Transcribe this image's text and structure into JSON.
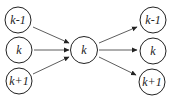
{
  "diagram": {
    "type": "flow",
    "colors": {
      "stroke": "#222222",
      "background": "#ffffff"
    },
    "nodes": [
      {
        "id": "in_km1",
        "label": "k-1",
        "cx": 18,
        "cy": 20,
        "r": 13
      },
      {
        "id": "in_k",
        "label": "k",
        "cx": 19,
        "cy": 50,
        "r": 13
      },
      {
        "id": "in_kp1",
        "label": "k+1",
        "cx": 19,
        "cy": 81,
        "r": 13
      },
      {
        "id": "center_k",
        "label": "k",
        "cx": 84,
        "cy": 50,
        "r": 13
      },
      {
        "id": "out_km1",
        "label": "k-1",
        "cx": 153,
        "cy": 20,
        "r": 13
      },
      {
        "id": "out_k",
        "label": "k",
        "cx": 153,
        "cy": 51,
        "r": 13
      },
      {
        "id": "out_kp1",
        "label": "k+1",
        "cx": 152,
        "cy": 82,
        "r": 13
      }
    ],
    "edges": [
      {
        "from": "in_km1",
        "to": "center_k"
      },
      {
        "from": "in_k",
        "to": "center_k"
      },
      {
        "from": "in_kp1",
        "to": "center_k"
      },
      {
        "from": "center_k",
        "to": "out_km1"
      },
      {
        "from": "center_k",
        "to": "out_k"
      },
      {
        "from": "center_k",
        "to": "out_kp1"
      }
    ]
  }
}
